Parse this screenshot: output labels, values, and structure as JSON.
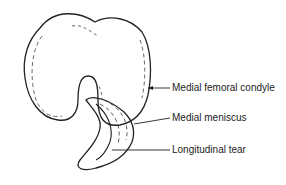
{
  "diagram": {
    "labels": [
      {
        "id": "condyle",
        "text": "Medial femoral condyle",
        "x": 172,
        "y": 88
      },
      {
        "id": "meniscus",
        "text": "Medial meniscus",
        "x": 172,
        "y": 118
      },
      {
        "id": "tear",
        "text": "Longitudinal tear",
        "x": 172,
        "y": 150
      }
    ],
    "colors": {
      "stroke": "#222222",
      "background": "#ffffff"
    }
  }
}
